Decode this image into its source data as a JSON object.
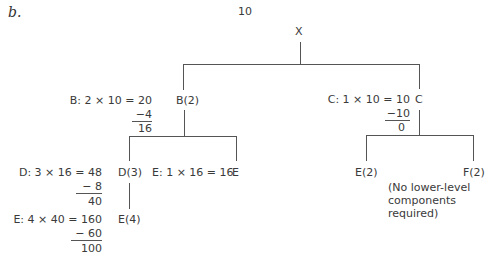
{
  "figure_label": "b.",
  "quantity": "10",
  "tree": {
    "root": "X",
    "level1": [
      {
        "node": "B(2)",
        "calc": {
          "line1": "B: 2 × 10 = 20",
          "subtract": "−4",
          "result": "16"
        },
        "children": [
          {
            "node": "D(3)",
            "calc": {
              "line1": "D: 3 × 16 = 48",
              "subtract": "− 8",
              "result": "40"
            },
            "children": [
              {
                "node": "E(4)",
                "calc": {
                  "line1": "E: 4 × 40 = 160",
                  "subtract": "− 60",
                  "result": "100"
                }
              }
            ]
          },
          {
            "node": "E",
            "calc": {
              "line1": "E: 1 × 16 = 16"
            }
          }
        ]
      },
      {
        "node": "C",
        "calc": {
          "line1": "C: 1 × 10 = 10",
          "subtract": "−10",
          "result": "0"
        },
        "children": [
          {
            "node": "E(2)"
          },
          {
            "node": "F(2)"
          }
        ],
        "note": "(No lower-level\ncomponents\nrequired)"
      }
    ]
  }
}
